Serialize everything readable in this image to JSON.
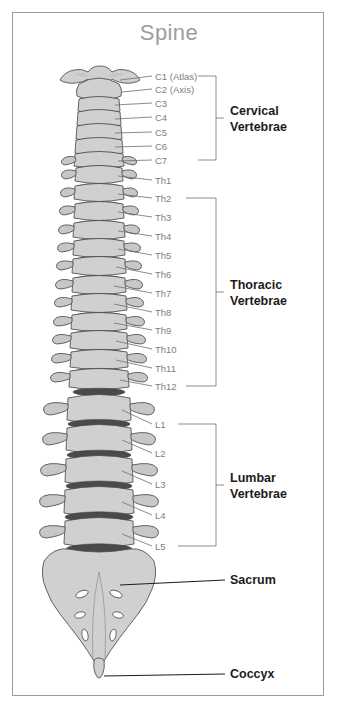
{
  "page": {
    "title": "Spine",
    "title_color": "#9d9d9d",
    "background": "#ffffff",
    "border_color": "#9b9b9b",
    "bone_fill": "#cfd0cf",
    "bone_stroke": "#4b4b4b",
    "disc_color": "#4a4a4a",
    "label_color": "#7d7d86",
    "group_label_color": "#1c1c1c"
  },
  "diagram": {
    "type": "anatomical-illustration",
    "vertebra_labels": [
      {
        "id": "c1",
        "text": "C1 (Atlas)",
        "y": 76,
        "line_from_x": 120,
        "line_to_x": 152,
        "anchor_y": 80
      },
      {
        "id": "c2",
        "text": "C2 (Axis)",
        "y": 89,
        "line_from_x": 122,
        "line_to_x": 152,
        "anchor_y": 92
      },
      {
        "id": "c3",
        "text": "C3",
        "y": 103,
        "line_from_x": 115,
        "line_to_x": 152,
        "anchor_y": 105
      },
      {
        "id": "c4",
        "text": "C4",
        "y": 117,
        "line_from_x": 115,
        "line_to_x": 152,
        "anchor_y": 119
      },
      {
        "id": "c5",
        "text": "C5",
        "y": 132,
        "line_from_x": 115,
        "line_to_x": 152,
        "anchor_y": 133
      },
      {
        "id": "c6",
        "text": "C6",
        "y": 146,
        "line_from_x": 115,
        "line_to_x": 152,
        "anchor_y": 147
      },
      {
        "id": "c7",
        "text": "C7",
        "y": 160,
        "line_from_x": 118,
        "line_to_x": 152,
        "anchor_y": 161
      },
      {
        "id": "th1",
        "text": "Th1",
        "y": 180,
        "line_from_x": 118,
        "line_to_x": 152,
        "anchor_y": 178
      },
      {
        "id": "th2",
        "text": "Th2",
        "y": 198,
        "line_from_x": 118,
        "line_to_x": 152,
        "anchor_y": 196
      },
      {
        "id": "th3",
        "text": "Th3",
        "y": 217,
        "line_from_x": 118,
        "line_to_x": 152,
        "anchor_y": 214
      },
      {
        "id": "th4",
        "text": "Th4",
        "y": 236,
        "line_from_x": 118,
        "line_to_x": 152,
        "anchor_y": 232
      },
      {
        "id": "th5",
        "text": "Th5",
        "y": 255,
        "line_from_x": 118,
        "line_to_x": 152,
        "anchor_y": 250
      },
      {
        "id": "th6",
        "text": "Th6",
        "y": 274,
        "line_from_x": 115,
        "line_to_x": 152,
        "anchor_y": 268
      },
      {
        "id": "th7",
        "text": "Th7",
        "y": 293,
        "line_from_x": 113,
        "line_to_x": 152,
        "anchor_y": 286
      },
      {
        "id": "th8",
        "text": "Th8",
        "y": 312,
        "line_from_x": 113,
        "line_to_x": 152,
        "anchor_y": 305
      },
      {
        "id": "th9",
        "text": "Th9",
        "y": 330,
        "line_from_x": 113,
        "line_to_x": 152,
        "anchor_y": 324
      },
      {
        "id": "th10",
        "text": "Th10",
        "y": 349,
        "line_from_x": 115,
        "line_to_x": 152,
        "anchor_y": 343
      },
      {
        "id": "th11",
        "text": "Th11",
        "y": 368,
        "line_from_x": 115,
        "line_to_x": 152,
        "anchor_y": 362
      },
      {
        "id": "th12",
        "text": "Th12",
        "y": 386,
        "line_from_x": 120,
        "line_to_x": 152,
        "anchor_y": 381
      },
      {
        "id": "l1",
        "text": "L1",
        "y": 424,
        "line_from_x": 122,
        "line_to_x": 152,
        "anchor_y": 421
      },
      {
        "id": "l2",
        "text": "L2",
        "y": 453,
        "line_from_x": 122,
        "line_to_x": 152,
        "anchor_y": 450
      },
      {
        "id": "l3",
        "text": "L3",
        "y": 484,
        "line_from_x": 122,
        "line_to_x": 152,
        "anchor_y": 481
      },
      {
        "id": "l4",
        "text": "L4",
        "y": 515,
        "line_from_x": 122,
        "line_to_x": 152,
        "anchor_y": 512
      },
      {
        "id": "l5",
        "text": "L5",
        "y": 546,
        "line_from_x": 122,
        "line_to_x": 152,
        "anchor_y": 543
      }
    ],
    "groups": [
      {
        "id": "cervical",
        "line1": "Cervical",
        "line2": "Vertebrae",
        "bracket_x": 216,
        "bracket_top": 76,
        "bracket_bottom": 160,
        "tick_y": 118,
        "label_x": 230,
        "label_y": 113
      },
      {
        "id": "thoracic",
        "line1": "Thoracic",
        "line2": "Vertebrae",
        "bracket_x": 216,
        "bracket_top": 198,
        "bracket_bottom": 386,
        "tick_y": 292,
        "label_x": 230,
        "label_y": 287
      },
      {
        "id": "lumbar",
        "line1": "Lumbar",
        "line2": "Vertebrae",
        "bracket_x": 216,
        "bracket_top": 424,
        "bracket_bottom": 546,
        "tick_y": 485,
        "label_x": 230,
        "label_y": 480
      }
    ],
    "parts": [
      {
        "id": "sacrum",
        "text": "Sacrum",
        "y": 584,
        "label_x": 230,
        "line_from_x": 120,
        "line_to_x": 225,
        "anchor_y": 580
      },
      {
        "id": "coccyx",
        "text": "Coccyx",
        "y": 678,
        "label_x": 230,
        "line_from_x": 104,
        "line_to_x": 225,
        "anchor_y": 674
      }
    ]
  }
}
